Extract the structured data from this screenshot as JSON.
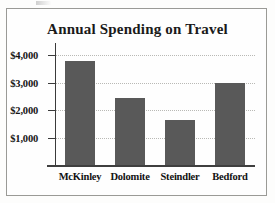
{
  "chart_data": {
    "type": "bar",
    "title": "Annual Spending on Travel",
    "xlabel": "",
    "ylabel": "",
    "categories": [
      "McKinley",
      "Dolomite",
      "Steindler",
      "Bedford"
    ],
    "values": [
      3800,
      2450,
      1650,
      3000
    ],
    "ylim": [
      0,
      4300
    ],
    "yticks": [
      1000,
      2000,
      3000,
      4000
    ],
    "ytick_labels": [
      "$1,000",
      "$2,000",
      "$3,000",
      "$4,000"
    ],
    "grid": true,
    "legend": null,
    "bar_color": "#595959",
    "axis_color": "#3a3a3a",
    "gridline_color": "#b9b9b5",
    "frame_color": "#9a9a96",
    "background": "#fefefe"
  }
}
